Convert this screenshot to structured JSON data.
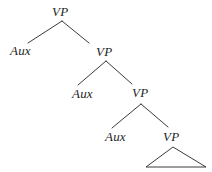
{
  "figure": {
    "name": "syntax-tree-vp-recursion",
    "background_color": "#ffffff",
    "ink_color": "#3a3a3a",
    "text_color": "#262626",
    "width": 212,
    "height": 172
  },
  "nodes": [
    {
      "id": "vp1",
      "label": "VP",
      "x": 52,
      "y": 5,
      "level": 0
    },
    {
      "id": "aux1",
      "label": "Aux",
      "x": 10,
      "y": 44,
      "level": 1
    },
    {
      "id": "vp2",
      "label": "VP",
      "x": 96,
      "y": 45,
      "level": 1
    },
    {
      "id": "aux2",
      "label": "Aux",
      "x": 72,
      "y": 87,
      "level": 2
    },
    {
      "id": "vp3",
      "label": "VP",
      "x": 132,
      "y": 86,
      "level": 2
    },
    {
      "id": "aux3",
      "label": "Aux",
      "x": 105,
      "y": 130,
      "level": 3
    },
    {
      "id": "vp4",
      "label": "VP",
      "x": 163,
      "y": 130,
      "level": 3
    }
  ],
  "branches": [
    {
      "id": "b1-left",
      "from": "vp1",
      "to": "aux1",
      "x1": 62,
      "y1": 21,
      "x2": 28,
      "y2": 43
    },
    {
      "id": "b1-right",
      "from": "vp1",
      "to": "vp2",
      "x1": 62,
      "y1": 21,
      "x2": 89,
      "y2": 43
    },
    {
      "id": "b2-left",
      "from": "vp2",
      "to": "aux2",
      "x1": 106,
      "y1": 61,
      "x2": 78,
      "y2": 85
    },
    {
      "id": "b2-right",
      "from": "vp2",
      "to": "vp3",
      "x1": 106,
      "y1": 61,
      "x2": 132,
      "y2": 84
    },
    {
      "id": "b3-left",
      "from": "vp3",
      "to": "aux3",
      "x1": 141,
      "y1": 104,
      "x2": 112,
      "y2": 128
    },
    {
      "id": "b3-right",
      "from": "vp3",
      "to": "vp4",
      "x1": 141,
      "y1": 104,
      "x2": 168,
      "y2": 127
    }
  ],
  "triangle": {
    "id": "vp4-triangle",
    "apex_x": 173,
    "apex_y": 147,
    "base_left_x": 146,
    "base_right_x": 206,
    "base_y": 167
  }
}
